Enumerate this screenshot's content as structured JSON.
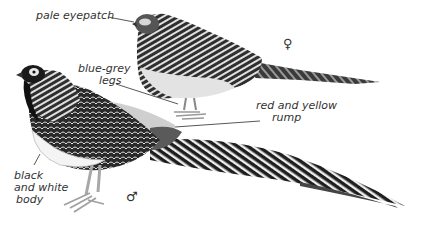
{
  "illustration": {
    "subject": "Lady Amherst's pheasant, female and male",
    "palette": {
      "ink": "#1a1a1a",
      "dark": "#333333",
      "mid": "#777777",
      "light": "#c8c8c8",
      "pale": "#ececec",
      "background": "#ffffff"
    }
  },
  "labels": {
    "eyepatch": "pale eyepatch",
    "legs_line1": "blue-grey",
    "legs_line2": "legs",
    "rump_line1": "red and yellow",
    "rump_line2": "rump",
    "body_line1": "black",
    "body_line2": "and white",
    "body_line3": "body"
  },
  "symbols": {
    "female": "♀",
    "male": "♂"
  }
}
